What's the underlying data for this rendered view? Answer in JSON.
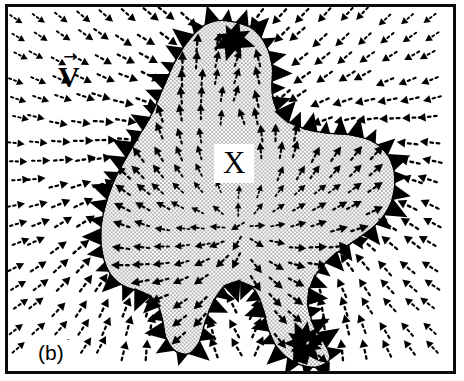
{
  "figure": {
    "panel_label": "(b)",
    "width": 464,
    "height": 381,
    "border_color": "#0b0b0b",
    "background_color": "#ffffff",
    "arrow_color": "#000000",
    "stipple_color": "#6f6f6f"
  },
  "labels": {
    "velocity_field": "V",
    "velocity_accent": "→",
    "region": "X"
  },
  "chart_data": {
    "type": "scatter",
    "title": "",
    "xlabel": "",
    "ylabel": "",
    "grid": false,
    "legend": null,
    "xlim": [
      0,
      451
    ],
    "ylim": [
      0,
      370
    ],
    "region_boundary": {
      "name": "X",
      "fill": "stipple",
      "stroke": "#000000",
      "points": [
        [
          222,
          14
        ],
        [
          248,
          22
        ],
        [
          262,
          40
        ],
        [
          268,
          62
        ],
        [
          268,
          88
        ],
        [
          276,
          110
        ],
        [
          296,
          122
        ],
        [
          322,
          128
        ],
        [
          348,
          130
        ],
        [
          372,
          138
        ],
        [
          388,
          156
        ],
        [
          392,
          180
        ],
        [
          386,
          204
        ],
        [
          370,
          224
        ],
        [
          348,
          240
        ],
        [
          326,
          256
        ],
        [
          310,
          276
        ],
        [
          304,
          300
        ],
        [
          310,
          324
        ],
        [
          322,
          344
        ],
        [
          326,
          358
        ],
        [
          312,
          366
        ],
        [
          292,
          362
        ],
        [
          274,
          348
        ],
        [
          264,
          328
        ],
        [
          258,
          306
        ],
        [
          250,
          288
        ],
        [
          236,
          280
        ],
        [
          220,
          284
        ],
        [
          208,
          300
        ],
        [
          200,
          320
        ],
        [
          194,
          340
        ],
        [
          184,
          352
        ],
        [
          170,
          350
        ],
        [
          160,
          336
        ],
        [
          156,
          316
        ],
        [
          150,
          300
        ],
        [
          136,
          290
        ],
        [
          118,
          284
        ],
        [
          104,
          272
        ],
        [
          96,
          252
        ],
        [
          94,
          228
        ],
        [
          98,
          204
        ],
        [
          106,
          180
        ],
        [
          118,
          156
        ],
        [
          132,
          132
        ],
        [
          146,
          108
        ],
        [
          158,
          80
        ],
        [
          170,
          54
        ],
        [
          186,
          30
        ],
        [
          204,
          16
        ]
      ]
    },
    "arrow_field": {
      "glyph": "dotted-tail-solid-head-arrow",
      "outer_description": "Uniform-ish far-field flow that converges on the region from all sides: arrows at top point down, arrows at left point left, arrows at right point right, arrows at bottom point up, with streamlines curving around the blob.",
      "inner_description": "Inside region X the arrows fan outward from the interior toward the boundary along curved streamlines.",
      "boundary_description": "Very large solid black arrowheads are densely clustered along the region boundary, largest at the top apex, left flank, right flank and at the bottom-right lobe."
    }
  }
}
